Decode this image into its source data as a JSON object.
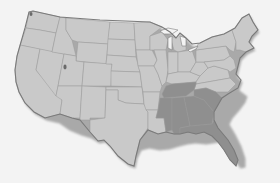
{
  "map": {
    "title": "Contiguous United States",
    "colors": {
      "background": "#f3f3f3",
      "base_fill": "#c9c9c9",
      "highlight_fill": "#8f8f8f",
      "border": "#9a9a9a"
    },
    "highlighted_region": "Southeast",
    "highlighted_states": [
      "Tennessee",
      "Mississippi",
      "Alabama",
      "Georgia",
      "South Carolina",
      "Florida"
    ],
    "other_states_label": "Rest of contiguous US",
    "legend": []
  }
}
